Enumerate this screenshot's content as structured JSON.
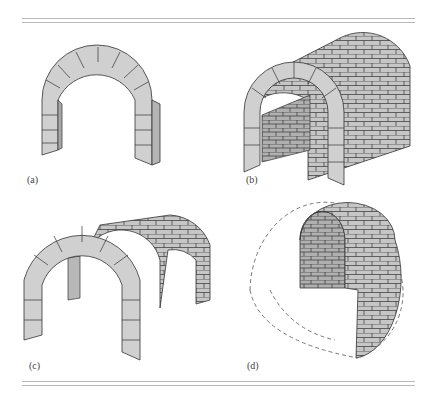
{
  "figure": {
    "panels": [
      {
        "id": "a",
        "label": "(a)",
        "description": "Single arch"
      },
      {
        "id": "b",
        "label": "(b)",
        "description": "Barrel vault"
      },
      {
        "id": "c",
        "label": "(c)",
        "description": "Groin vault (intersecting barrel vaults)"
      },
      {
        "id": "d",
        "label": "(d)",
        "description": "Dome (cut-away, dashed outline of full dome)"
      }
    ],
    "colors": {
      "stone_light": "#d4d4d4",
      "stone_mid": "#c2c2c2",
      "stone_dark": "#a8a8a8",
      "mortar_line": "#333333",
      "rule": "#b8b8b8"
    }
  }
}
